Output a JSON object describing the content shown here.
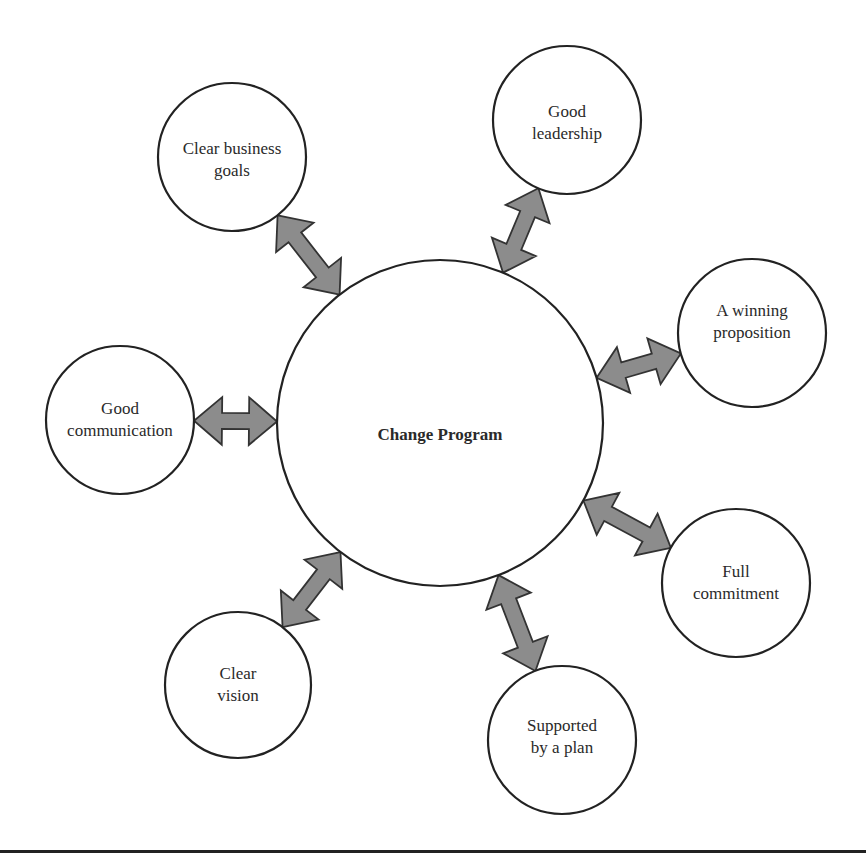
{
  "diagram": {
    "center": {
      "label": "Change Program",
      "cx": 440,
      "cy": 423,
      "r": 163
    },
    "nodes": [
      {
        "id": "clear-business-goals",
        "lines": [
          "Clear business",
          "goals"
        ],
        "cx": 232,
        "cy": 157,
        "r": 74
      },
      {
        "id": "good-leadership",
        "lines": [
          "Good",
          "leadership"
        ],
        "cx": 567,
        "cy": 120,
        "r": 74
      },
      {
        "id": "a-winning-proposition",
        "lines": [
          "A winning",
          "proposition"
        ],
        "cx": 752,
        "cy": 333,
        "r": 74
      },
      {
        "id": "full-commitment",
        "lines": [
          "Full",
          "commitment"
        ],
        "cx": 736,
        "cy": 583,
        "r": 74
      },
      {
        "id": "supported-by-a-plan",
        "lines": [
          "Supported",
          "by a plan"
        ],
        "cx": 562,
        "cy": 740,
        "r": 74
      },
      {
        "id": "clear-vision",
        "lines": [
          "Clear",
          "vision"
        ],
        "cx": 238,
        "cy": 685,
        "r": 73
      },
      {
        "id": "good-communication",
        "lines": [
          "Good",
          "communication"
        ],
        "cx": 120,
        "cy": 420,
        "r": 74
      }
    ],
    "connector": {
      "type": "double-headed-arrow",
      "fill": "#8c8c8c",
      "stroke": "#333333"
    },
    "footer_rule": true
  }
}
